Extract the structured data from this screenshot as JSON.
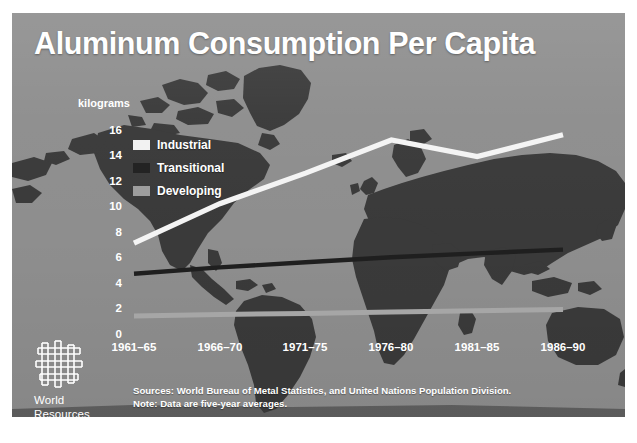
{
  "poster": {
    "title": "Aluminum Consumption Per Capita",
    "background_color": "#8e8e8e",
    "map_color": "#3a3a3a"
  },
  "legend": {
    "position": "inside-upper-left",
    "items": [
      {
        "label": "Industrial",
        "color": "#f2f2f2",
        "swatch_icon": "legend-swatch-industrial"
      },
      {
        "label": "Transitional",
        "color": "#232323",
        "swatch_icon": "legend-swatch-transitional"
      },
      {
        "label": "Developing",
        "color": "#9d9d9d",
        "swatch_icon": "legend-swatch-developing"
      }
    ]
  },
  "axes": {
    "y_units_label": "kilograms",
    "y_ticks": [
      "16",
      "14",
      "12",
      "10",
      "8",
      "6",
      "4",
      "2",
      "0"
    ],
    "x_ticks": [
      "1961–65",
      "1966–70",
      "1971–75",
      "1976–80",
      "1981–85",
      "1986–90"
    ]
  },
  "notes": {
    "sources": "Sources: World Bureau of Metal Statistics, and United Nations Population Division.",
    "note": "Note: Data are five-year averages."
  },
  "branding": {
    "logo_icon": "wri-woven-logo-icon",
    "name_line_1": "World",
    "name_line_2": "Resources",
    "name_line_3": "Institute"
  },
  "chart_data": {
    "type": "line",
    "title": "Aluminum Consumption Per Capita",
    "xlabel": "",
    "ylabel": "kilograms",
    "ylim": [
      0,
      16
    ],
    "ytick_values": [
      0,
      2,
      4,
      6,
      8,
      10,
      12,
      14,
      16
    ],
    "grid": false,
    "legend_position": "inside-upper-left",
    "categories": [
      "1961-65",
      "1966-70",
      "1971-75",
      "1976-80",
      "1981-85",
      "1986-90"
    ],
    "series": [
      {
        "name": "Industrial",
        "color": "#f2f2f2",
        "values": [
          6.1,
          9.2,
          11.6,
          14.2,
          12.9,
          14.6
        ]
      },
      {
        "name": "Transitional",
        "color": "#232323",
        "values": [
          3.7,
          4.2,
          4.6,
          5.0,
          5.3,
          5.6
        ]
      },
      {
        "name": "Developing",
        "color": "#9d9d9d",
        "values": [
          0.4,
          0.5,
          0.6,
          0.7,
          0.8,
          0.9
        ]
      }
    ],
    "annotations": [
      "Sources: World Bureau of Metal Statistics, and United Nations Population Division.",
      "Note: Data are five-year averages."
    ]
  }
}
